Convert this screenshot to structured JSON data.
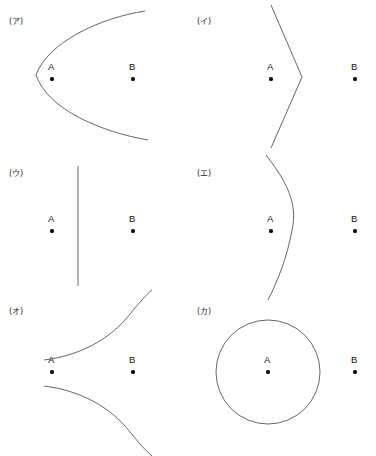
{
  "sheet": {
    "width": 376,
    "height": 456,
    "background": "#ffffff",
    "stroke_color": "#4a4a4a",
    "point_color": "#111111",
    "label_color": "#2b2b2b"
  },
  "panels": [
    {
      "id": "panel-a",
      "label": "(ア)",
      "shape": "parabola-opening-right",
      "points": [
        {
          "name": "A",
          "x": 52,
          "y": 79
        },
        {
          "name": "B",
          "x": 133,
          "y": 79
        }
      ]
    },
    {
      "id": "panel-b",
      "label": "(イ)",
      "shape": "angle-v-opening-left",
      "points": [
        {
          "name": "A",
          "x": 83,
          "y": 79
        },
        {
          "name": "B",
          "x": 167,
          "y": 79
        }
      ]
    },
    {
      "id": "panel-c",
      "label": "(ウ)",
      "shape": "vertical-straight-line",
      "points": [
        {
          "name": "A",
          "x": 52,
          "y": 79
        },
        {
          "name": "B",
          "x": 133,
          "y": 79
        }
      ]
    },
    {
      "id": "panel-d",
      "label": "(エ)",
      "shape": "single-arc-bulging-right",
      "points": [
        {
          "name": "A",
          "x": 83,
          "y": 79
        },
        {
          "name": "B",
          "x": 167,
          "y": 79
        }
      ]
    },
    {
      "id": "panel-e",
      "label": "(オ)",
      "shape": "hyperbola-branch-opening-left",
      "points": [
        {
          "name": "A",
          "x": 52,
          "y": 82
        },
        {
          "name": "B",
          "x": 133,
          "y": 82
        }
      ]
    },
    {
      "id": "panel-f",
      "label": "(カ)",
      "shape": "circle-around-a",
      "points": [
        {
          "name": "A",
          "x": 80,
          "y": 82
        },
        {
          "name": "B",
          "x": 167,
          "y": 82
        }
      ]
    }
  ]
}
